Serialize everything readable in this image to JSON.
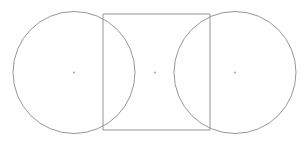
{
  "figure": {
    "kind": "geometry-diagram",
    "canvas": {
      "width": 308,
      "height": 146,
      "background": "#ffffff"
    },
    "style": {
      "stroke_color": "#8a8a8a",
      "stroke_width": 0.9,
      "dot_color": "#9a9a9a",
      "fill": "none"
    },
    "shapes": [
      {
        "name": "left-circle",
        "type": "circle",
        "cx": 74,
        "cy": 72.5,
        "r": 61
      },
      {
        "name": "right-circle",
        "type": "circle",
        "cx": 235,
        "cy": 72.5,
        "r": 61
      },
      {
        "name": "center-rectangle",
        "type": "rectangle",
        "x": 103,
        "y": 14,
        "width": 107,
        "height": 116
      }
    ],
    "markers": [
      {
        "name": "left-circle-center-dot",
        "cx": 74,
        "cy": 72.5,
        "r": 0.9
      },
      {
        "name": "rectangle-center-dot",
        "cx": 155,
        "cy": 72.5,
        "r": 0.9
      },
      {
        "name": "right-circle-center-dot",
        "cx": 235,
        "cy": 72.5,
        "r": 0.9
      }
    ],
    "labels": []
  }
}
